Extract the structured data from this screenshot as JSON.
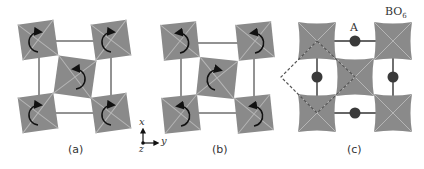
{
  "figure": {
    "panels": [
      {
        "id": "a",
        "caption": "(a)",
        "description": "in-phase octahedral tilt pattern: corner octahedra rotate clockwise, center rotates counterclockwise"
      },
      {
        "id": "b",
        "caption": "(b)",
        "description": "opposite tilt pattern: corner octahedra rotate counterclockwise, center rotates clockwise"
      },
      {
        "id": "c",
        "caption": "(c)",
        "description": "untilted perovskite layer with A-site cations between BO6 octahedra; dashed square marks unit cell"
      }
    ],
    "axes": {
      "x_label": "x",
      "y_label": "y",
      "z_label": "z"
    },
    "labels": {
      "a_site": "A",
      "octahedron": "BO",
      "octahedron_sub": "6"
    },
    "colors": {
      "octahedron": "#8a8a8a",
      "octahedron_edge": "#b5b5b5",
      "frame_line": "#6f6f6f",
      "arrow": "#111111",
      "a_site": "#3a3a3a",
      "dashed": "#555555",
      "background": "#ffffff"
    }
  }
}
